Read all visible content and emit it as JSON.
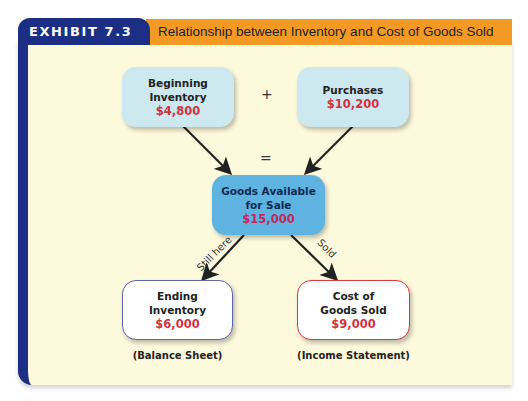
{
  "exhibit": {
    "tab_label": "EXHIBIT 7.3",
    "title": "Relationship between Inventory and Cost of Goods Sold"
  },
  "colors": {
    "tab_navy": "#1c2f84",
    "title_orange": "#f39a25",
    "panel_bg": "#fdf9dc",
    "amount_red": "#d1323f"
  },
  "nodes": {
    "beginning_inventory": {
      "line1": "Beginning",
      "line2": "Inventory",
      "amount": "$4,800"
    },
    "purchases": {
      "line1": "Purchases",
      "amount": "$10,200"
    },
    "goods_available": {
      "line1": "Goods Available",
      "line2": "for Sale",
      "amount": "$15,000"
    },
    "ending_inventory": {
      "line1": "Ending",
      "line2": "Inventory",
      "amount": "$6,000",
      "caption": "(Balance Sheet)"
    },
    "cogs": {
      "line1": "Cost of",
      "line2": "Goods Sold",
      "amount": "$9,000",
      "caption": "(Income Statement)"
    }
  },
  "operators": {
    "plus": "+",
    "equals": "="
  },
  "edge_labels": {
    "still_here": "Still here",
    "sold": "Sold"
  }
}
